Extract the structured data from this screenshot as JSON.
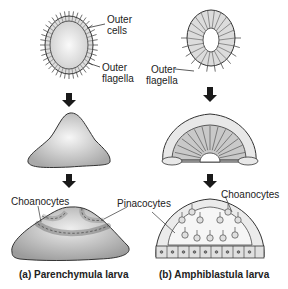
{
  "labels": {
    "outer_cells": "Outer",
    "outer_cells_2": "cells",
    "outer_flagella_left": "Outer",
    "outer_flagella_left_2": "flagella",
    "outer_flagella_right": "Outer",
    "outer_flagella_right_2": "flagella",
    "choanocytes_left": "Choanocytes",
    "pinacocytes": "Pinacocytes",
    "choanocytes_right": "Choanocytes"
  },
  "captions": {
    "a": "(a) Parenchymula larva",
    "b": "(b) Amphiblastula larva"
  },
  "colors": {
    "stroke": "#333333",
    "fill_gray": "#bdbdbd",
    "fill_light": "#e6e6e6",
    "arrow": "#1a1a1a"
  }
}
